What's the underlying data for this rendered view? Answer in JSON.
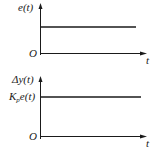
{
  "diagrams": [
    {
      "name": "input-signal",
      "y_label": "e(t)",
      "x_label": "t",
      "origin_label": "O",
      "signal": "constant step",
      "level_label": ""
    },
    {
      "name": "proportional-output",
      "y_label": "Δy(t)",
      "x_label": "t",
      "origin_label": "O",
      "signal": "constant step",
      "level_label_main": "K",
      "level_label_sub": "p",
      "level_label_tail": "e(t)"
    }
  ],
  "colors": {
    "line": "#1a1a1a",
    "background": "#ffffff"
  }
}
